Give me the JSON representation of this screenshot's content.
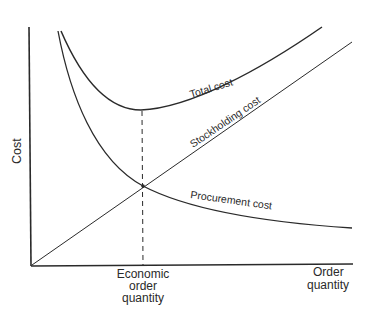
{
  "diagram": {
    "axes": {
      "y_label": "Cost",
      "x_label_line1": "Order",
      "x_label_line2": "quantity"
    },
    "curves": {
      "total_cost": "Total cost",
      "stockholding_cost": "Stockholding cost",
      "procurement_cost": "Procurement cost"
    },
    "marker": {
      "line1": "Economic",
      "line2": "order",
      "line3": "quantity"
    },
    "colors": {
      "ink": "#2a2a2a",
      "background": "#ffffff"
    }
  }
}
